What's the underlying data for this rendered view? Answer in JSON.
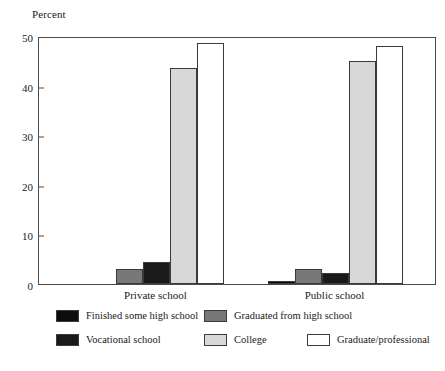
{
  "chart_data": {
    "type": "bar",
    "title": "",
    "subtitle": "",
    "xlabel": "",
    "ylabel": "Percent",
    "ylim": [
      0,
      50
    ],
    "yticks": [
      0,
      10,
      20,
      30,
      40,
      50
    ],
    "ytick_labels": [
      "0",
      "10",
      "20",
      "30",
      "40",
      "50"
    ],
    "grid": false,
    "legend_position": "bottom",
    "categories": [
      "Private school",
      "Public school"
    ],
    "series": [
      {
        "name": "Finished some high school",
        "color": "#0d0d0d",
        "values": [
          0,
          0.6
        ]
      },
      {
        "name": "Graduated from  high school",
        "color": "#787878",
        "values": [
          3.0,
          3.0
        ]
      },
      {
        "name": "Vocational school",
        "color": "#1a1a1a",
        "values": [
          4.4,
          2.2
        ]
      },
      {
        "name": "College",
        "color": "#d8d8d8",
        "values": [
          43.5,
          44.9
        ]
      },
      {
        "name": "Graduate/professional",
        "color": "#ffffff",
        "values": [
          48.6,
          48.0
        ]
      }
    ]
  },
  "axis": {
    "y_title": "Percent"
  },
  "legend": {
    "entries": [
      {
        "label": "Finished some high school",
        "swatch": "#0d0d0d"
      },
      {
        "label": "Graduated from  high school",
        "swatch": "#787878"
      },
      {
        "label": "Vocational school",
        "swatch": "#1a1a1a"
      },
      {
        "label": "College",
        "swatch": "#d8d8d8"
      },
      {
        "label": "Graduate/professional",
        "swatch": "#ffffff"
      }
    ]
  }
}
